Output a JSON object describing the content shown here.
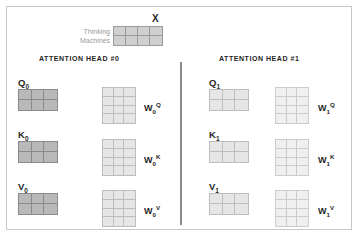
{
  "diagram": {
    "input": {
      "title": "X",
      "row_labels": [
        "Thinking",
        "Machines"
      ],
      "matrix": {
        "cols": 4,
        "rows": 2,
        "shade": "mid"
      }
    },
    "heads": [
      {
        "title": "ATTENTION HEAD #0",
        "shade_small": "dark",
        "shade_weight": "light",
        "rows": [
          {
            "vector_label": "Q",
            "vector_sub": "0",
            "vector_matrix": {
              "cols": 3,
              "rows": 2
            },
            "weight_label": "W",
            "weight_sub": "0",
            "weight_sup": "Q",
            "weight_matrix": {
              "cols": 3,
              "rows": 4
            }
          },
          {
            "vector_label": "K",
            "vector_sub": "0",
            "vector_matrix": {
              "cols": 3,
              "rows": 2
            },
            "weight_label": "W",
            "weight_sub": "0",
            "weight_sup": "K",
            "weight_matrix": {
              "cols": 3,
              "rows": 4
            }
          },
          {
            "vector_label": "V",
            "vector_sub": "0",
            "vector_matrix": {
              "cols": 3,
              "rows": 2
            },
            "weight_label": "W",
            "weight_sub": "0",
            "weight_sup": "V",
            "weight_matrix": {
              "cols": 3,
              "rows": 4
            }
          }
        ]
      },
      {
        "title": "ATTENTION HEAD #1",
        "shade_small": "light",
        "shade_weight": "pale",
        "rows": [
          {
            "vector_label": "Q",
            "vector_sub": "1",
            "vector_matrix": {
              "cols": 3,
              "rows": 2
            },
            "weight_label": "W",
            "weight_sub": "1",
            "weight_sup": "Q",
            "weight_matrix": {
              "cols": 3,
              "rows": 4
            }
          },
          {
            "vector_label": "K",
            "vector_sub": "1",
            "vector_matrix": {
              "cols": 3,
              "rows": 2
            },
            "weight_label": "W",
            "weight_sub": "1",
            "weight_sup": "K",
            "weight_matrix": {
              "cols": 3,
              "rows": 4
            }
          },
          {
            "vector_label": "V",
            "vector_sub": "1",
            "vector_matrix": {
              "cols": 3,
              "rows": 2
            },
            "weight_label": "W",
            "weight_sub": "1",
            "weight_sup": "V",
            "weight_matrix": {
              "cols": 3,
              "rows": 4
            }
          }
        ]
      }
    ],
    "colors": {
      "border": "#c9c9c9",
      "divider": "#8c8c8c",
      "cell_dark": "#b9b9b9",
      "cell_mid": "#cfcfcf",
      "cell_light": "#e6e6e6",
      "cell_pale": "#f0f0f0",
      "text": "#1f1f1f",
      "word_text": "#9a9a9a"
    }
  }
}
